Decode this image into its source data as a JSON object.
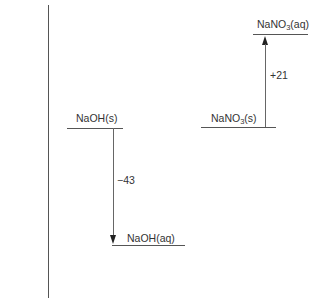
{
  "diagram": {
    "type": "enthalpy-level-diagram",
    "axis": {
      "orientation": "vertical",
      "x": 48,
      "y_top": 5,
      "y_bottom": 298
    },
    "left_process": {
      "initial": {
        "formula": "NaOH",
        "state": "(s)",
        "level_y": 128,
        "x1": 67,
        "x2": 123
      },
      "final": {
        "formula": "NaOH",
        "state": "(aq)",
        "level_y": 245,
        "x1": 112,
        "x2": 185
      },
      "arrow": {
        "direction": "down",
        "x": 113
      },
      "enthalpy_change": "−43"
    },
    "right_process": {
      "initial": {
        "formula": "NaNO",
        "subscript": "3",
        "state": "(s)",
        "level_y": 127,
        "x1": 201,
        "x2": 276
      },
      "final": {
        "formula": "NaNO",
        "subscript": "3",
        "state": "(aq)",
        "level_y": 34,
        "x1": 253,
        "x2": 308
      },
      "arrow": {
        "direction": "up",
        "x": 265
      },
      "enthalpy_change": "+21"
    }
  }
}
